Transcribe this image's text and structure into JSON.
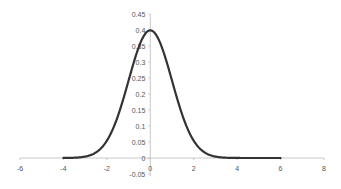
{
  "chart_data": {
    "type": "line",
    "title": "",
    "xlabel": "",
    "ylabel": "",
    "xlim": [
      -6,
      8
    ],
    "ylim": [
      -0.05,
      0.45
    ],
    "grid": false,
    "legend": null,
    "x_ticks": [
      "-6",
      "-4",
      "-2",
      "0",
      "2",
      "4",
      "6",
      "8"
    ],
    "y_ticks": [
      "-0.05",
      "0",
      "0.05",
      "0.1",
      "0.15",
      "0.2",
      "0.25",
      "0.3",
      "0.35",
      "0.4",
      "0.45"
    ],
    "series": [
      {
        "name": "Normal density",
        "color": "#333333",
        "x": [
          -4,
          -3.5,
          -3,
          -2.5,
          -2,
          -1.5,
          -1,
          -0.5,
          0,
          0.5,
          1,
          1.5,
          2,
          2.5,
          3,
          3.5,
          4,
          4.5,
          5,
          5.5,
          6
        ],
        "values": [
          0.0001,
          0.0009,
          0.0044,
          0.0175,
          0.054,
          0.1295,
          0.242,
          0.3521,
          0.3989,
          0.3521,
          0.242,
          0.1295,
          0.054,
          0.0175,
          0.0044,
          0.0009,
          0.0001,
          0.0,
          0.0,
          0.0,
          0.0
        ]
      }
    ]
  }
}
